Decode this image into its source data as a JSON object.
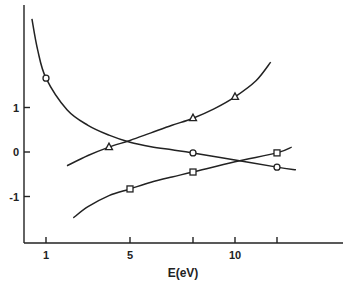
{
  "chart_data": {
    "type": "line",
    "title": "",
    "xlabel": "E(eV)",
    "ylabel": "",
    "xlim": [
      0,
      15.4
    ],
    "ylim": [
      -2.04,
      3.3
    ],
    "grid": false,
    "legend": null,
    "x_ticks": [
      1,
      5,
      8,
      10,
      12
    ],
    "x_tick_labels": [
      "1",
      "5",
      "",
      "10",
      ""
    ],
    "y_ticks": [
      1,
      0,
      -1
    ],
    "y_tick_labels": [
      "1",
      "0",
      "-1"
    ],
    "series": [
      {
        "name": "circles",
        "marker": "circle",
        "points": [
          {
            "x": 1,
            "y": 1.66
          },
          {
            "x": 8,
            "y": -0.02
          },
          {
            "x": 12,
            "y": -0.34
          }
        ],
        "curve": [
          [
            0.33,
            2.99
          ],
          [
            0.6,
            2.3
          ],
          [
            1,
            1.66
          ],
          [
            2,
            0.95
          ],
          [
            3,
            0.6
          ],
          [
            4,
            0.38
          ],
          [
            5,
            0.22
          ],
          [
            6,
            0.12
          ],
          [
            7,
            0.05
          ],
          [
            8,
            -0.02
          ],
          [
            10,
            -0.18
          ],
          [
            12,
            -0.34
          ],
          [
            12.9,
            -0.4
          ]
        ]
      },
      {
        "name": "triangles",
        "marker": "triangle",
        "points": [
          {
            "x": 4,
            "y": 0.11
          },
          {
            "x": 8,
            "y": 0.76
          },
          {
            "x": 10,
            "y": 1.24
          }
        ],
        "curve": [
          [
            2,
            -0.31
          ],
          [
            3,
            -0.08
          ],
          [
            4,
            0.11
          ],
          [
            5,
            0.26
          ],
          [
            6,
            0.43
          ],
          [
            7,
            0.6
          ],
          [
            8,
            0.76
          ],
          [
            9,
            0.97
          ],
          [
            10,
            1.24
          ],
          [
            11,
            1.6
          ],
          [
            11.7,
            2.02
          ]
        ]
      },
      {
        "name": "squares",
        "marker": "square",
        "points": [
          {
            "x": 5,
            "y": -0.83
          },
          {
            "x": 8,
            "y": -0.45
          },
          {
            "x": 12,
            "y": -0.02
          }
        ],
        "curve": [
          [
            2.3,
            -1.48
          ],
          [
            3,
            -1.23
          ],
          [
            4,
            -0.98
          ],
          [
            5,
            -0.83
          ],
          [
            6,
            -0.68
          ],
          [
            7,
            -0.56
          ],
          [
            8,
            -0.45
          ],
          [
            10,
            -0.22
          ],
          [
            12,
            -0.02
          ],
          [
            12.7,
            0.11
          ]
        ]
      }
    ]
  }
}
